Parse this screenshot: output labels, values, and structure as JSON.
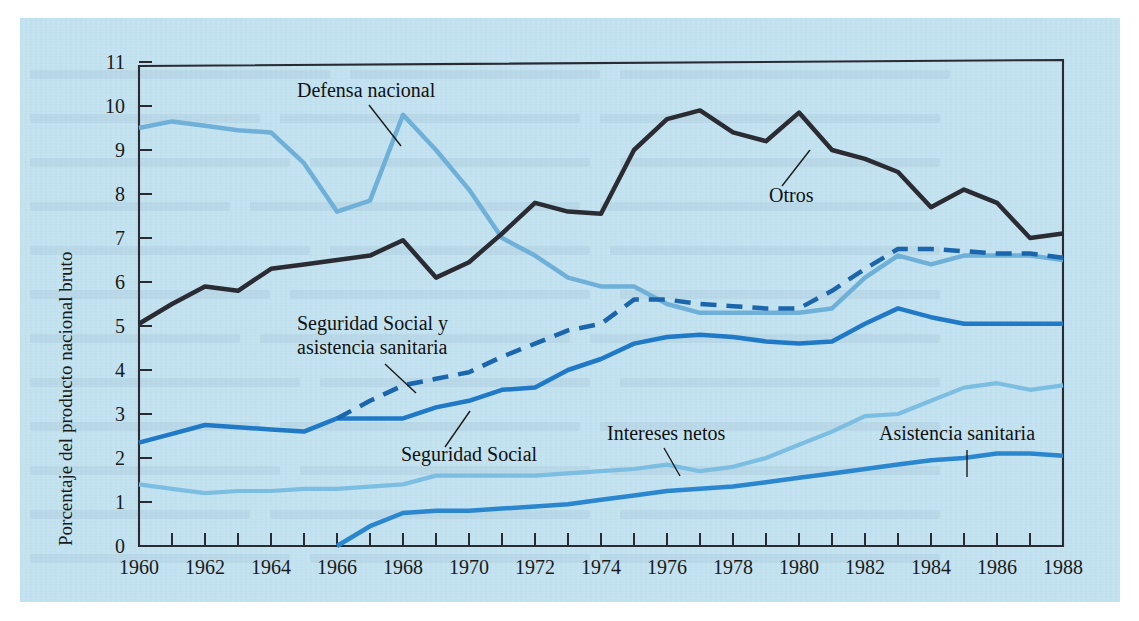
{
  "figure": {
    "background_color": "#c3e2f0",
    "page_color": "#ffffff",
    "frame_color": "#2a2a33"
  },
  "axis": {
    "y_title": "Porcentaje del producto nacional bruto",
    "y_ticks": [
      "0",
      "1",
      "2",
      "3",
      "4",
      "5",
      "6",
      "7",
      "8",
      "9",
      "10",
      "11"
    ],
    "x_ticks": [
      "1960",
      "1962",
      "1964",
      "1966",
      "1968",
      "1970",
      "1972",
      "1974",
      "1976",
      "1978",
      "1980",
      "1982",
      "1984",
      "1986",
      "1988"
    ]
  },
  "labels": {
    "defensa": "Defensa nacional",
    "otros": "Otros",
    "segsoc_asis": "Seguridad Social y",
    "segsoc_asis2": "asistencia sanitaria",
    "segsoc": "Seguridad Social",
    "intereses": "Intereses netos",
    "asistencia": "Asistencia sanitaria"
  },
  "chart_data": {
    "type": "line",
    "title": "",
    "xlabel": "",
    "ylabel": "Porcentaje del producto nacional bruto",
    "xlim": [
      1960,
      1988
    ],
    "ylim": [
      0,
      11
    ],
    "grid": false,
    "legend": "inline-annotations",
    "x": [
      1960,
      1961,
      1962,
      1963,
      1964,
      1965,
      1966,
      1967,
      1968,
      1969,
      1970,
      1971,
      1972,
      1973,
      1974,
      1975,
      1976,
      1977,
      1978,
      1979,
      1980,
      1981,
      1982,
      1983,
      1984,
      1985,
      1986,
      1987,
      1988
    ],
    "series": [
      {
        "name": "Defensa nacional",
        "color": "#6fb0d8",
        "style": "solid",
        "width": 4.5,
        "values": [
          9.5,
          9.65,
          9.55,
          9.45,
          9.4,
          8.7,
          7.6,
          7.85,
          9.8,
          9.0,
          8.1,
          7.0,
          6.6,
          6.1,
          5.9,
          5.9,
          5.5,
          5.3,
          5.3,
          5.3,
          5.3,
          5.4,
          6.1,
          6.6,
          6.4,
          6.6,
          6.6,
          6.6,
          6.5
        ]
      },
      {
        "name": "Otros",
        "color": "#2b2b33",
        "style": "solid",
        "width": 4.5,
        "values": [
          5.05,
          5.5,
          5.9,
          5.8,
          6.3,
          6.4,
          6.5,
          6.6,
          6.95,
          6.1,
          6.45,
          7.1,
          7.8,
          7.6,
          7.55,
          9.0,
          9.7,
          9.9,
          9.4,
          9.2,
          9.85,
          9.0,
          8.8,
          8.5,
          7.7,
          8.1,
          7.8,
          7.0,
          7.1
        ]
      },
      {
        "name": "Seguridad Social y asistencia sanitaria",
        "color": "#1b65ac",
        "style": "dashed",
        "width": 4.5,
        "values": [
          null,
          null,
          null,
          null,
          null,
          null,
          2.9,
          3.3,
          3.65,
          3.8,
          3.95,
          4.3,
          4.6,
          4.9,
          5.05,
          5.6,
          5.6,
          5.5,
          5.45,
          5.4,
          5.4,
          5.8,
          6.3,
          6.75,
          6.75,
          6.7,
          6.65,
          6.65,
          6.55
        ]
      },
      {
        "name": "Seguridad Social",
        "color": "#2079c7",
        "style": "solid",
        "width": 4.5,
        "values": [
          2.35,
          2.55,
          2.75,
          2.7,
          2.65,
          2.6,
          2.9,
          2.9,
          2.9,
          3.15,
          3.3,
          3.55,
          3.6,
          4.0,
          4.25,
          4.6,
          4.75,
          4.8,
          4.75,
          4.65,
          4.6,
          4.65,
          5.05,
          5.4,
          5.2,
          5.05,
          5.05,
          5.05,
          5.05
        ]
      },
      {
        "name": "Intereses netos",
        "color": "#7cbde2",
        "style": "solid",
        "width": 4.2,
        "values": [
          1.4,
          1.3,
          1.2,
          1.25,
          1.25,
          1.3,
          1.3,
          1.35,
          1.4,
          1.6,
          1.6,
          1.6,
          1.6,
          1.65,
          1.7,
          1.75,
          1.85,
          1.7,
          1.8,
          2.0,
          2.3,
          2.6,
          2.95,
          3.0,
          3.3,
          3.6,
          3.7,
          3.55,
          3.65
        ]
      },
      {
        "name": "Asistencia sanitaria",
        "color": "#2a86cf",
        "style": "solid",
        "width": 4.5,
        "values": [
          null,
          null,
          null,
          null,
          null,
          null,
          0.0,
          0.45,
          0.75,
          0.8,
          0.8,
          0.85,
          0.9,
          0.95,
          1.05,
          1.15,
          1.25,
          1.3,
          1.35,
          1.45,
          1.55,
          1.65,
          1.75,
          1.85,
          1.95,
          2.0,
          2.1,
          2.1,
          2.05
        ]
      }
    ]
  }
}
